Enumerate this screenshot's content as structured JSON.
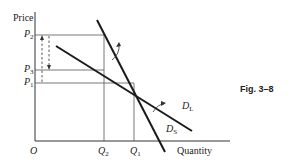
{
  "axes": {
    "y_label": "Price",
    "x_label": "Quantity",
    "origin": "O"
  },
  "price_levels": [
    {
      "symbol": "P",
      "sub": "2"
    },
    {
      "symbol": "P",
      "sub": "3"
    },
    {
      "symbol": "P",
      "sub": "1"
    }
  ],
  "quantity_levels": [
    {
      "symbol": "Q",
      "sub": "2"
    },
    {
      "symbol": "Q",
      "sub": "1"
    }
  ],
  "curves": [
    {
      "symbol": "D",
      "sub": "L",
      "description": "long-run demand (flatter)"
    },
    {
      "symbol": "D",
      "sub": "S",
      "description": "short-run demand (steeper)"
    }
  ],
  "caption": "Fig. 3–8",
  "colors": {
    "line": "#1a1a1a",
    "guide": "#444444"
  }
}
